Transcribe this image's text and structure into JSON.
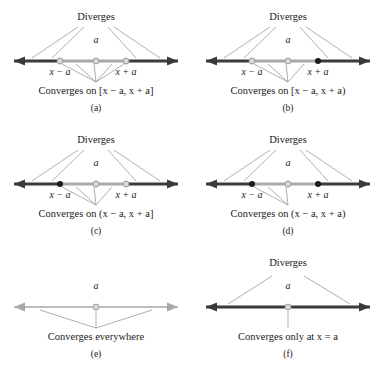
{
  "figure": {
    "colors": {
      "dark_line": "#3a3a3a",
      "gray_line": "#a8a8a8",
      "connector": "#8c8c8c",
      "open_dot_fill": "#d9d9d9",
      "open_dot_stroke": "#9a9a9a",
      "closed_dot": "#1a1a1a",
      "text": "#1a1a1a",
      "background": "#ffffff"
    },
    "axis": {
      "center_label": "a",
      "left_tick_label": "x − a",
      "right_tick_label": "x + a"
    },
    "diverges_label": "Diverges"
  },
  "panels": [
    {
      "id": "a",
      "label": "(a)",
      "diverges": "Diverges",
      "caption": "Converges on [x − a, x + a]",
      "center_label": "a",
      "left_tick_label": "x − a",
      "right_tick_label": "x + a",
      "left_endpoint": "open",
      "right_endpoint": "open",
      "center_dot": "open",
      "has_diverges": true,
      "line_mode": "interval",
      "fan_count": 5
    },
    {
      "id": "b",
      "label": "(b)",
      "diverges": "Diverges",
      "caption": "Converges on [x − a, x + a)",
      "center_label": "a",
      "left_tick_label": "x − a",
      "right_tick_label": "x + a",
      "left_endpoint": "open",
      "right_endpoint": "closed",
      "center_dot": "open",
      "has_diverges": true,
      "line_mode": "interval",
      "fan_count": 4
    },
    {
      "id": "c",
      "label": "(c)",
      "diverges": "Diverges",
      "caption": "Converges on (x − a, x + a]",
      "center_label": "a",
      "left_tick_label": "x − a",
      "right_tick_label": "x + a",
      "left_endpoint": "closed",
      "right_endpoint": "open",
      "center_dot": "open",
      "has_diverges": true,
      "line_mode": "interval",
      "fan_count": 4
    },
    {
      "id": "d",
      "label": "(d)",
      "diverges": "Diverges",
      "caption": "Converges on (x − a, x + a)",
      "center_label": "a",
      "left_tick_label": "x − a",
      "right_tick_label": "x + a",
      "left_endpoint": "closed",
      "right_endpoint": "closed",
      "center_dot": "open",
      "has_diverges": true,
      "line_mode": "interval",
      "fan_count": 3
    },
    {
      "id": "e",
      "label": "(e)",
      "diverges": "",
      "caption": "Converges everywhere",
      "center_label": "a",
      "left_tick_label": "",
      "right_tick_label": "",
      "left_endpoint": "none",
      "right_endpoint": "none",
      "center_dot": "open",
      "has_diverges": false,
      "line_mode": "all-gray",
      "fan_count": 3
    },
    {
      "id": "f",
      "label": "(f)",
      "diverges": "Diverges",
      "caption": "Converges only at x = a",
      "center_label": "a",
      "left_tick_label": "",
      "right_tick_label": "",
      "left_endpoint": "none",
      "right_endpoint": "none",
      "center_dot": "open",
      "has_diverges": true,
      "line_mode": "all-dark",
      "fan_count": 1
    }
  ]
}
